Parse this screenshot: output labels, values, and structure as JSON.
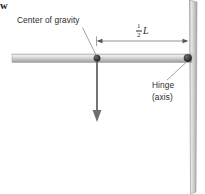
{
  "figure": {
    "background_color": "#ffffff",
    "width": 205,
    "height": 194
  },
  "labels": {
    "center_of_gravity": "Center of gravity",
    "hinge_line1": "Hinge",
    "hinge_line2": "(axis)",
    "weight": "w",
    "half_length_numerator": "1",
    "half_length_denominator": "2",
    "half_length_symbol": "L"
  },
  "colors": {
    "rod": "#b9b9b9",
    "rod_highlight": "#e8e8e8",
    "wall": "#b0b0b0",
    "wall_highlight": "#e6e6e6",
    "dot": "#333333",
    "line": "#707070",
    "arrow": "#6e6e6e",
    "text": "#2b2b2b"
  },
  "geometry": {
    "rod_left_x": 12,
    "rod_right_x": 192,
    "rod_center_y": 58,
    "rod_thickness": 8,
    "wall_x": 189,
    "wall_width": 8,
    "cg_x": 97,
    "cg_y": 58,
    "hinge_x": 188,
    "hinge_y": 58,
    "dimension_line_y": 41,
    "weight_arrow_tip_y": 122
  }
}
